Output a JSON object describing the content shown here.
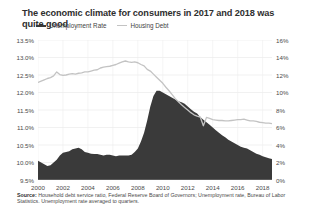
{
  "title": "The economic climate for consumers in 2017 and 2018 was quite good",
  "legend": [
    {
      "label": "Unemployment Rate",
      "color": "#3a3a3a",
      "style": "area"
    },
    {
      "label": "Housing Debt",
      "color": "#c3c3c3",
      "style": "line"
    }
  ],
  "source": {
    "prefix": "Source:",
    "text": " Household debt service ratio, Federal Reserve Board of Governors; Unemployment rate, Bureau of Labor Statistics. Unemployment rate averaged to quarters."
  },
  "chart_data": {
    "type": "area",
    "title": "The economic climate for consumers in 2017 and 2018 was quite good",
    "xlabel": "",
    "ylabel": "",
    "grid": true,
    "legend_position": "top-left",
    "x_ticks": [
      "2000",
      "2002",
      "2004",
      "2006",
      "2008",
      "2010",
      "2012",
      "2014",
      "2016",
      "2018"
    ],
    "x_tick_values": [
      2000,
      2002,
      2004,
      2006,
      2008,
      2010,
      2012,
      2014,
      2016,
      2018
    ],
    "xlim": [
      2000,
      2018.75
    ],
    "left_axis": {
      "name": "Unemployment Rate",
      "ticks": [
        "9.5%",
        "10.0%",
        "10.5%",
        "11.0%",
        "11.5%",
        "12.0%",
        "12.5%",
        "13.0%",
        "13.5%"
      ],
      "tick_values": [
        9.5,
        10.0,
        10.5,
        11.0,
        11.5,
        12.0,
        12.5,
        13.0,
        13.5
      ],
      "ylim": [
        9.5,
        13.5
      ],
      "color": "#3a3a3a"
    },
    "right_axis": {
      "name": "Housing Debt",
      "ticks": [
        "0%",
        "2%",
        "4%",
        "6%",
        "8%",
        "10%",
        "12%",
        "14%",
        "16%"
      ],
      "tick_values": [
        0,
        2,
        4,
        6,
        8,
        10,
        12,
        14,
        16
      ],
      "ylim": [
        0,
        16
      ],
      "color": "#c3c3c3"
    },
    "series": [
      {
        "name": "Unemployment Rate",
        "axis": "left",
        "type": "area",
        "color": "#3a3a3a",
        "x": [
          2000.0,
          2000.25,
          2000.5,
          2000.75,
          2001.0,
          2001.25,
          2001.5,
          2001.75,
          2002.0,
          2002.25,
          2002.5,
          2002.75,
          2003.0,
          2003.25,
          2003.5,
          2003.75,
          2004.0,
          2004.25,
          2004.5,
          2004.75,
          2005.0,
          2005.25,
          2005.5,
          2005.75,
          2006.0,
          2006.25,
          2006.5,
          2006.75,
          2007.0,
          2007.25,
          2007.5,
          2007.75,
          2008.0,
          2008.25,
          2008.5,
          2008.75,
          2009.0,
          2009.25,
          2009.5,
          2009.75,
          2010.0,
          2010.25,
          2010.5,
          2010.75,
          2011.0,
          2011.25,
          2011.5,
          2011.75,
          2012.0,
          2012.25,
          2012.5,
          2012.75,
          2013.0,
          2013.25,
          2013.5,
          2013.75,
          2014.0,
          2014.25,
          2014.5,
          2014.75,
          2015.0,
          2015.25,
          2015.5,
          2015.75,
          2016.0,
          2016.25,
          2016.5,
          2016.75,
          2017.0,
          2017.25,
          2017.5,
          2017.75,
          2018.0,
          2018.25,
          2018.5,
          2018.75
        ],
        "values": [
          10.05,
          10.0,
          9.95,
          9.9,
          9.92,
          10.0,
          10.08,
          10.2,
          10.28,
          10.3,
          10.32,
          10.38,
          10.4,
          10.42,
          10.38,
          10.3,
          10.28,
          10.25,
          10.24,
          10.24,
          10.22,
          10.2,
          10.22,
          10.22,
          10.2,
          10.18,
          10.2,
          10.2,
          10.2,
          10.2,
          10.22,
          10.3,
          10.4,
          10.6,
          10.85,
          11.2,
          11.6,
          11.9,
          12.05,
          12.05,
          12.0,
          11.95,
          11.9,
          11.85,
          11.8,
          11.75,
          11.72,
          11.68,
          11.6,
          11.52,
          11.45,
          11.4,
          11.3,
          11.22,
          11.15,
          11.08,
          11.0,
          10.92,
          10.85,
          10.78,
          10.72,
          10.65,
          10.6,
          10.55,
          10.5,
          10.45,
          10.42,
          10.4,
          10.35,
          10.3,
          10.25,
          10.22,
          10.18,
          10.15,
          10.12,
          10.1
        ]
      },
      {
        "name": "Housing Debt",
        "axis": "right",
        "type": "line",
        "color": "#c3c3c3",
        "x": [
          2000.0,
          2000.25,
          2000.5,
          2000.75,
          2001.0,
          2001.25,
          2001.5,
          2001.75,
          2002.0,
          2002.25,
          2002.5,
          2002.75,
          2003.0,
          2003.25,
          2003.5,
          2003.75,
          2004.0,
          2004.25,
          2004.5,
          2004.75,
          2005.0,
          2005.25,
          2005.5,
          2005.75,
          2006.0,
          2006.25,
          2006.5,
          2006.75,
          2007.0,
          2007.25,
          2007.5,
          2007.75,
          2008.0,
          2008.25,
          2008.5,
          2008.75,
          2009.0,
          2009.25,
          2009.5,
          2009.75,
          2010.0,
          2010.25,
          2010.5,
          2010.75,
          2011.0,
          2011.25,
          2011.5,
          2011.75,
          2012.0,
          2012.25,
          2012.5,
          2012.75,
          2013.0,
          2013.25,
          2013.5,
          2013.75,
          2014.0,
          2014.25,
          2014.5,
          2014.75,
          2015.0,
          2015.25,
          2015.5,
          2015.75,
          2016.0,
          2016.25,
          2016.5,
          2016.75,
          2017.0,
          2017.25,
          2017.5,
          2017.75,
          2018.0,
          2018.25,
          2018.5,
          2018.75
        ],
        "values": [
          11.15,
          11.3,
          11.45,
          11.6,
          11.7,
          11.9,
          12.35,
          12.05,
          11.95,
          12.0,
          12.1,
          12.15,
          12.1,
          12.2,
          12.25,
          12.35,
          12.35,
          12.45,
          12.55,
          12.6,
          12.8,
          12.9,
          12.95,
          13.0,
          13.1,
          13.2,
          13.35,
          13.5,
          13.6,
          13.5,
          13.45,
          13.5,
          13.4,
          13.2,
          13.05,
          12.65,
          12.45,
          12.1,
          11.75,
          11.4,
          11.05,
          10.6,
          10.2,
          9.75,
          9.3,
          8.95,
          8.6,
          8.3,
          8.0,
          7.7,
          7.45,
          7.3,
          7.2,
          6.2,
          7.15,
          7.05,
          6.9,
          6.85,
          6.8,
          6.8,
          6.75,
          6.75,
          6.8,
          6.85,
          6.9,
          6.9,
          6.95,
          6.85,
          6.75,
          6.75,
          6.7,
          6.6,
          6.55,
          6.5,
          6.5,
          6.45
        ]
      }
    ]
  }
}
